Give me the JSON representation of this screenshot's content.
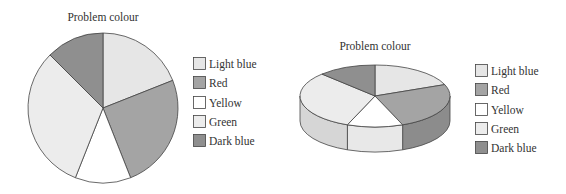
{
  "chart_data": [
    {
      "type": "pie",
      "variant": "2d",
      "title": "Problem colour",
      "start_angle": "12 o'clock",
      "direction": "clockwise",
      "legend_position": "right",
      "categories": [
        "Light blue",
        "Red",
        "Yellow",
        "Green",
        "Dark blue"
      ],
      "values": [
        19,
        25,
        12,
        31.5,
        12.5
      ],
      "unit": "percent (estimated from slice angles)",
      "fills": [
        "#e6e6e6",
        "#a4a4a4",
        "#ffffff",
        "#ececec",
        "#8f8f8f"
      ]
    },
    {
      "type": "pie",
      "variant": "3d",
      "title": "Problem colour",
      "start_angle": "12 o'clock",
      "direction": "clockwise",
      "legend_position": "right",
      "categories": [
        "Light blue",
        "Red",
        "Yellow",
        "Green",
        "Dark blue"
      ],
      "values": [
        19,
        25,
        12,
        31.5,
        12.5
      ],
      "unit": "percent (estimated from slice angles)",
      "fills": [
        "#e6e6e6",
        "#a4a4a4",
        "#ffffff",
        "#ececec",
        "#8f8f8f"
      ],
      "side_fills": [
        "#d2d2d2",
        "#8c8c8c",
        "#e8e8e8",
        "#d6d6d6",
        "#7a7a7a"
      ]
    }
  ],
  "colors": {
    "outline": "#444444",
    "text": "#333333",
    "background": "#ffffff"
  }
}
